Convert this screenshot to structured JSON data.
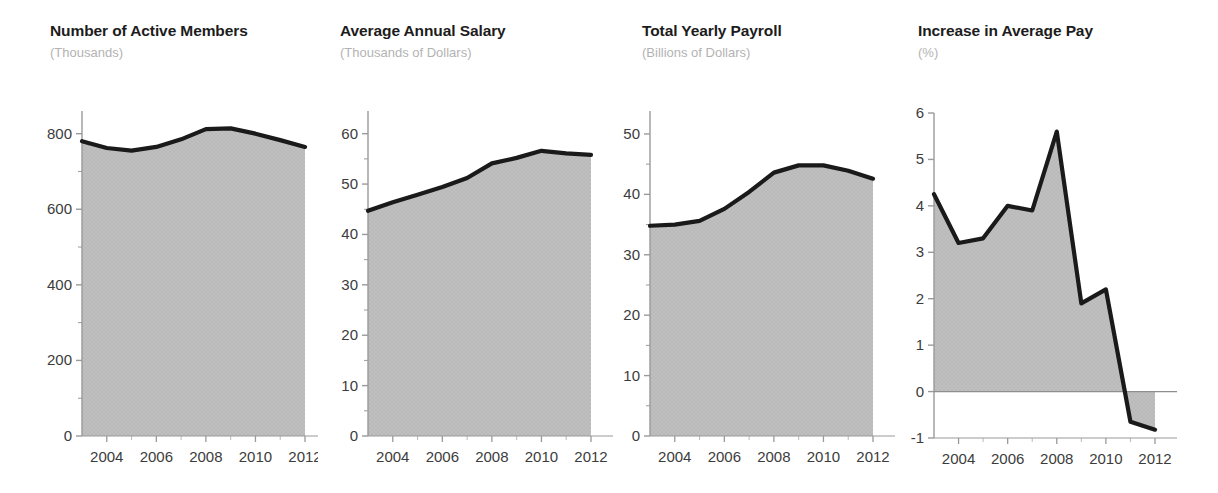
{
  "figure": {
    "panel_count": 4,
    "fill_color": "#b9b9b9",
    "line_color": "#1a1a1a",
    "axis_color": "#9a9a9a",
    "tick_label_color": "#3c3c3c",
    "subtitle_color": "#b3b3b3",
    "background": "#ffffff"
  },
  "chart_data": [
    {
      "type": "area",
      "title": "Number of Active Members",
      "subtitle": "(Thousands)",
      "xlabel": "",
      "ylabel": "",
      "unit": "Thousands",
      "grid": false,
      "legend": "none",
      "x": [
        2003,
        2004,
        2005,
        2006,
        2007,
        2008,
        2009,
        2010,
        2011,
        2012
      ],
      "values": [
        780,
        762,
        755,
        765,
        785,
        812,
        814,
        800,
        783,
        765
      ],
      "xlim": [
        2003,
        2012
      ],
      "ylim": [
        0,
        860
      ],
      "yticks": [
        0,
        200,
        400,
        600,
        800
      ],
      "ytick_labels": [
        "0",
        "200",
        "400",
        "600",
        "800"
      ],
      "yminor": [
        100,
        300,
        500,
        700
      ],
      "xticks": [
        2004,
        2006,
        2008,
        2010,
        2012
      ],
      "xtick_labels": [
        "2004",
        "2006",
        "2008",
        "2010",
        "2012"
      ]
    },
    {
      "type": "area",
      "title": "Average Annual Salary",
      "subtitle": "(Thousands of Dollars)",
      "xlabel": "",
      "ylabel": "",
      "unit": "Thousands of Dollars",
      "grid": false,
      "legend": "none",
      "x": [
        2003,
        2004,
        2005,
        2006,
        2007,
        2008,
        2009,
        2010,
        2011,
        2012
      ],
      "values": [
        44.7,
        46.4,
        47.9,
        49.4,
        51.2,
        54.1,
        55.2,
        56.6,
        56.1,
        55.8
      ],
      "xlim": [
        2003,
        2012
      ],
      "ylim": [
        0,
        64.5
      ],
      "yticks": [
        0,
        10,
        20,
        30,
        40,
        50,
        60
      ],
      "ytick_labels": [
        "0",
        "10",
        "20",
        "30",
        "40",
        "50",
        "60"
      ],
      "yminor": [
        5,
        15,
        25,
        35,
        45,
        55
      ],
      "xticks": [
        2004,
        2006,
        2008,
        2010,
        2012
      ],
      "xtick_labels": [
        "2004",
        "2006",
        "2008",
        "2010",
        "2012"
      ]
    },
    {
      "type": "area",
      "title": "Total Yearly Payroll",
      "subtitle": "(Billions of Dollars)",
      "xlabel": "",
      "ylabel": "",
      "unit": "Billions of Dollars",
      "grid": false,
      "legend": "none",
      "x": [
        2003,
        2004,
        2005,
        2006,
        2007,
        2008,
        2009,
        2010,
        2011,
        2012
      ],
      "values": [
        34.8,
        35.0,
        35.6,
        37.6,
        40.4,
        43.6,
        44.8,
        44.8,
        43.9,
        42.6
      ],
      "xlim": [
        2003,
        2012
      ],
      "ylim": [
        0,
        53.8
      ],
      "yticks": [
        0,
        10,
        20,
        30,
        40,
        50
      ],
      "ytick_labels": [
        "0",
        "10",
        "20",
        "30",
        "40",
        "50"
      ],
      "yminor": [
        5,
        15,
        25,
        35,
        45
      ],
      "xticks": [
        2004,
        2006,
        2008,
        2010,
        2012
      ],
      "xtick_labels": [
        "2004",
        "2006",
        "2008",
        "2010",
        "2012"
      ]
    },
    {
      "type": "area",
      "title": "Increase in Average Pay",
      "subtitle": "(%)",
      "xlabel": "",
      "ylabel": "",
      "unit": "%",
      "grid": false,
      "legend": "none",
      "baseline": 0,
      "x": [
        2003,
        2004,
        2005,
        2006,
        2007,
        2008,
        2009,
        2010,
        2011,
        2012
      ],
      "values": [
        4.25,
        3.2,
        3.3,
        4.0,
        3.9,
        5.6,
        1.9,
        2.2,
        -0.65,
        -0.82
      ],
      "xlim": [
        2003,
        2012
      ],
      "ylim": [
        -1,
        6
      ],
      "yticks": [
        -1,
        0,
        1,
        2,
        3,
        4,
        5,
        6
      ],
      "ytick_labels": [
        "-1",
        "0",
        "1",
        "2",
        "3",
        "4",
        "5",
        "6"
      ],
      "yminor": [],
      "xticks": [
        2004,
        2006,
        2008,
        2010,
        2012
      ],
      "xtick_labels": [
        "2004",
        "2006",
        "2008",
        "2010",
        "2012"
      ],
      "xminor_all_years": true
    }
  ]
}
